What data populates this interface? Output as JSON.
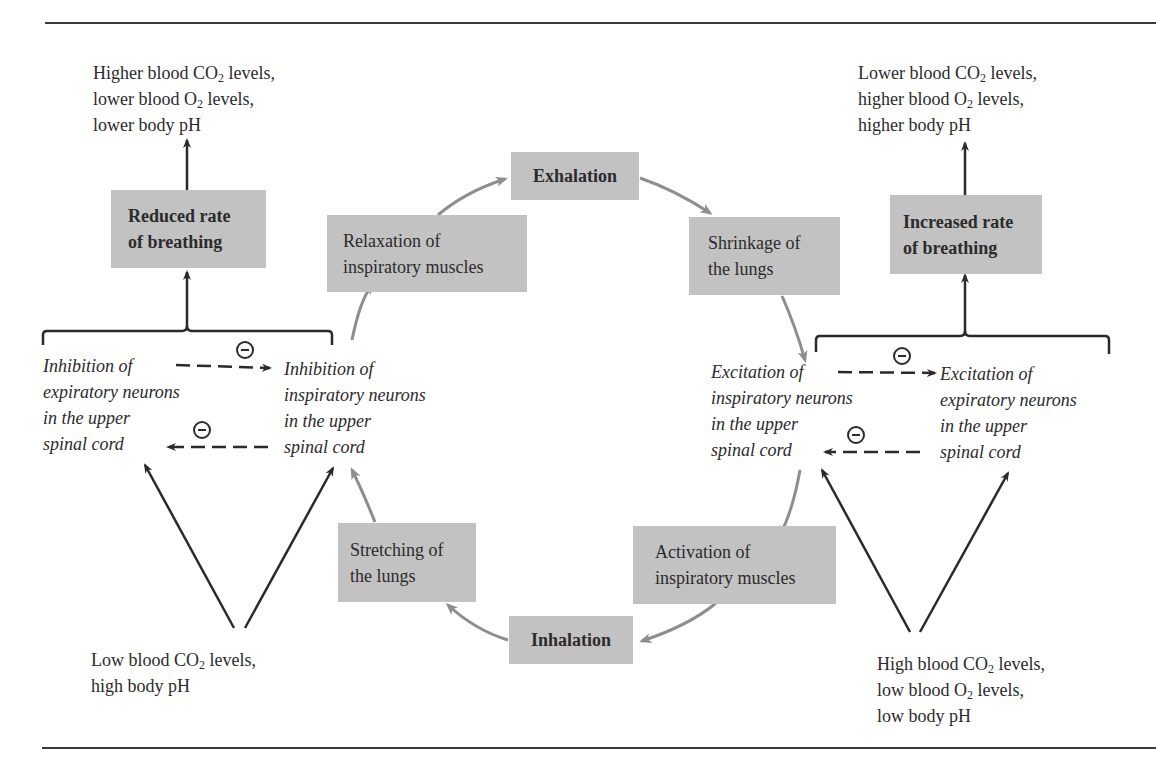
{
  "figure": {
    "colors": {
      "box_fill": "#c2c2c2",
      "cycle_arrow": "#8e8e8e",
      "control_arrow": "#2a2a2a",
      "text": "#2b2b2b"
    }
  },
  "cycle": {
    "exhalation": "Exhalation",
    "shrinkage_line1": "Shrinkage of",
    "shrinkage_line2": "the lungs",
    "activation_line1": "Activation of",
    "activation_line2": "inspiratory muscles",
    "inhalation": "Inhalation",
    "stretching_line1": "Stretching of",
    "stretching_line2": "the lungs",
    "relaxation_line1": "Relaxation of",
    "relaxation_line2": "inspiratory muscles"
  },
  "left": {
    "outcome": {
      "line1_pre": "Higher blood CO",
      "line1_sub": "2",
      "line1_post": " levels,",
      "line2_pre": "lower blood O",
      "line2_sub": "2",
      "line2_post": " levels,",
      "line3": "lower body pH"
    },
    "rate_box_line1": "Reduced rate",
    "rate_box_line2": "of breathing",
    "neuron_a": [
      "Inhibition of",
      "expiratory neurons",
      "in the upper",
      "spinal cord"
    ],
    "neuron_b": [
      "Inhibition of",
      "inspiratory neurons",
      "in the upper",
      "spinal cord"
    ],
    "stimulus": {
      "line1_pre": "Low blood CO",
      "line1_sub": "2",
      "line1_post": " levels,",
      "line2": "high body pH"
    },
    "inhibit_symbol": "−"
  },
  "right": {
    "outcome": {
      "line1_pre": "Lower blood CO",
      "line1_sub": "2",
      "line1_post": " levels,",
      "line2_pre": "higher blood O",
      "line2_sub": "2",
      "line2_post": " levels,",
      "line3": "higher body pH"
    },
    "rate_box_line1": "Increased rate",
    "rate_box_line2": "of breathing",
    "neuron_a": [
      "Excitation of",
      "inspiratory neurons",
      "in the upper",
      "spinal cord"
    ],
    "neuron_b": [
      "Excitation of",
      "expiratory neurons",
      "in the upper",
      "spinal cord"
    ],
    "stimulus": {
      "line1_pre": "High blood CO",
      "line1_sub": "2",
      "line1_post": " levels,",
      "line2_pre": "low blood O",
      "line2_sub": "2",
      "line2_post": " levels,",
      "line3": "low body pH"
    },
    "inhibit_symbol": "−"
  }
}
